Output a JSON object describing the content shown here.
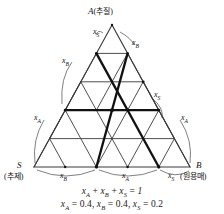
{
  "figure": {
    "type": "ternary-phase-diagram",
    "grid_divisions": 5,
    "vertices": {
      "apex": {
        "letter": "A",
        "korean": "(추질)",
        "full": "A(추질)"
      },
      "bottom_left": {
        "letter": "S",
        "korean": "(추제)"
      },
      "bottom_right": {
        "letter": "B",
        "korean": "(원용매)"
      }
    },
    "edge_labels": {
      "apex_left": {
        "base": "x",
        "sub": "S"
      },
      "apex_right": {
        "base": "x",
        "sub": "B"
      },
      "left_upper": {
        "base": "x",
        "sub": "B"
      },
      "left_lower": {
        "base": "x",
        "sub": "A"
      },
      "right_upper": {
        "base": "x",
        "sub": "S"
      },
      "right_lower": {
        "base": "x",
        "sub": "A"
      },
      "bottom_left_seg": {
        "base": "x",
        "sub": "B"
      },
      "bottom_mid_seg": {
        "base": "x",
        "sub": "A"
      },
      "bottom_right_seg": {
        "base": "x",
        "sub": "S"
      }
    },
    "equations": {
      "sum": {
        "terms": [
          "x_A",
          "x_B",
          "x_S"
        ],
        "rhs": "1",
        "text": "xA + xB + xS = 1"
      },
      "values": {
        "x_A": "0.4",
        "x_B": "0.4",
        "x_S": "0.2",
        "text": "xA = 0.4, xB = 0.4, xS = 0.2"
      }
    },
    "colors": {
      "grid_line": "#3a3a3a",
      "bold_line": "#111111",
      "background": "#ffffff",
      "text": "#111111"
    },
    "composition_point": {
      "x_A": 0.4,
      "x_B": 0.4,
      "x_S": 0.2
    }
  }
}
